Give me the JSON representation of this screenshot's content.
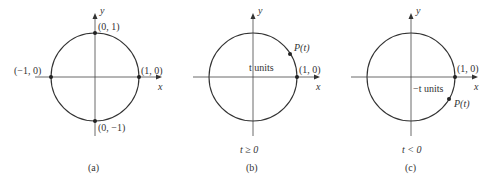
{
  "figure": {
    "colors": {
      "stroke": "#333333",
      "axis": "#444444"
    },
    "panels": [
      {
        "id": "a",
        "caption": "(a)",
        "axis_x_label": "x",
        "axis_y_label": "y",
        "points": {
          "top": "(0, 1)",
          "bottom": "(0, −1)",
          "left": "(−1, 0)",
          "right": "(1, 0)"
        }
      },
      {
        "id": "b",
        "caption": "(b)",
        "condition": "t ≥ 0",
        "axis_x_label": "x",
        "axis_y_label": "y",
        "point_label": "P(t)",
        "arc_label": "t units",
        "start_label": "(1, 0)"
      },
      {
        "id": "c",
        "caption": "(c)",
        "condition": "t < 0",
        "axis_x_label": "x",
        "axis_y_label": "y",
        "point_label": "P(t)",
        "arc_label": "−t units",
        "start_label": "(1, 0)"
      }
    ]
  }
}
